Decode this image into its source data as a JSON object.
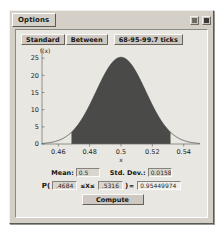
{
  "window": {
    "title": "Options",
    "controls": [
      {
        "name": "restore-button",
        "glyph": "restore"
      },
      {
        "name": "close-button",
        "glyph": "close"
      }
    ]
  },
  "toolbar": {
    "standard_label": "Standard",
    "between_label": "Between",
    "ticks_label": "68-95-99.7 ticks"
  },
  "params": {
    "mean_label": "Mean:",
    "mean_value": "0.5",
    "sd_label": "Std. Dev.:",
    "sd_value": "0.0158",
    "prob_prefix": "P(",
    "lower_value": ".4684",
    "inequality": "≤X≤",
    "paren_close": ")",
    "equals": "=",
    "result_value": "0.95449974",
    "compute_label": "Compute"
  },
  "chart_data": {
    "type": "area",
    "title": "",
    "xlabel": "x",
    "ylabel": "f(x)",
    "xlim": [
      0.4496,
      0.5504
    ],
    "ylim": [
      0,
      26.5
    ],
    "xticks": [
      "0.46",
      "0.48",
      "0.5",
      "0.52",
      "0.54"
    ],
    "xtick_values": [
      0.46,
      0.48,
      0.5,
      0.52,
      0.54
    ],
    "yticks": [
      "0",
      "5",
      "10",
      "15",
      "20",
      "25"
    ],
    "ytick_values": [
      0,
      5,
      10,
      15,
      20,
      25
    ],
    "grid": false,
    "legend": null,
    "distribution": {
      "kind": "normal",
      "mean": 0.5,
      "std_dev": 0.0158,
      "peak_density": 25.25
    },
    "shaded_region": {
      "from": 0.4684,
      "to": 0.5316,
      "area": 0.95449974,
      "color": "#4a4a48"
    },
    "curve_color": "#3b3b39"
  }
}
